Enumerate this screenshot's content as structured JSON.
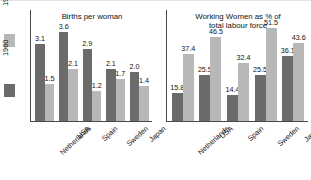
{
  "legend": {
    "entries": [
      {
        "label": "1999",
        "color": "#b8b8b8"
      },
      {
        "label": "1960",
        "color": "#6b6b6b"
      }
    ]
  },
  "colors": {
    "series_1960": "#6b6b6b",
    "series_1999": "#b8b8b8",
    "axis": "#4a4a4a",
    "text": "#111111",
    "background": "#ffffff"
  },
  "chart_data": [
    {
      "type": "bar",
      "title": "Births per woman",
      "xlabel": "",
      "ylabel": "",
      "ylim": [
        0,
        4
      ],
      "grid": false,
      "legend_position": "left-outside",
      "categories": [
        "Netherlands",
        "USA",
        "Spain",
        "Sweden",
        "Japan"
      ],
      "series": [
        {
          "name": "1960",
          "color": "#6b6b6b",
          "values": [
            3.1,
            3.6,
            2.9,
            2.1,
            2.0
          ]
        },
        {
          "name": "1999",
          "color": "#b8b8b8",
          "values": [
            1.5,
            2.1,
            1.2,
            1.7,
            1.4
          ]
        }
      ]
    },
    {
      "type": "bar",
      "title": "Working Women as % of\ntotal labour force",
      "xlabel": "",
      "ylabel": "",
      "ylim": [
        0,
        55
      ],
      "grid": false,
      "legend_position": "left-outside",
      "categories": [
        "Netherlands",
        "USA",
        "Spain",
        "Sweden",
        "Japan"
      ],
      "series": [
        {
          "name": "1960",
          "color": "#6b6b6b",
          "values": [
            15.8,
            25.5,
            14.4,
            25.5,
            36.1
          ]
        },
        {
          "name": "1999",
          "color": "#b8b8b8",
          "values": [
            37.4,
            46.5,
            32.4,
            51.5,
            43.6
          ]
        }
      ]
    }
  ]
}
